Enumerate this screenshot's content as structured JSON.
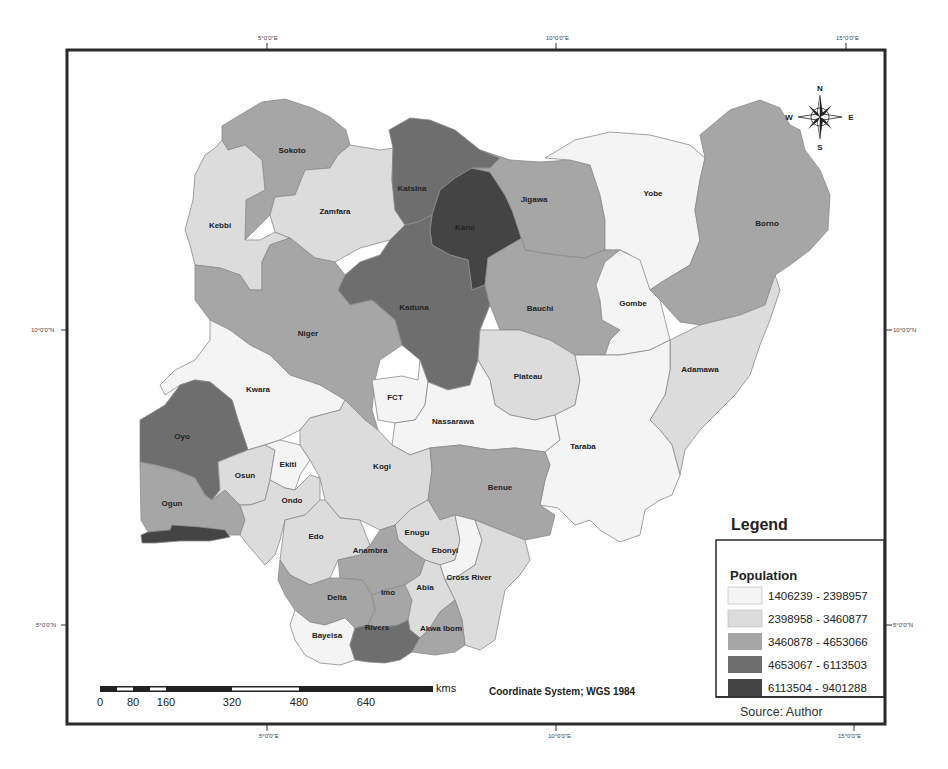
{
  "graticule": {
    "top_labels": [
      "5°0'0\"E",
      "10°0'0\"E",
      "15°0'0\"E"
    ],
    "bottom_labels": [
      "5°0'0\"E",
      "10°0'0\"E",
      "15°0'0\"E"
    ],
    "left_labels": [
      "10°0'0\"N",
      "5°0'0\"N"
    ],
    "right_labels": [
      "10°0'0\"N",
      "5°0'0\"N"
    ]
  },
  "compass": {
    "n": "N",
    "s": "S",
    "e": "E",
    "w": "W",
    "icon": "compass-rose-icon"
  },
  "colors": {
    "class1": "#f4f4f4",
    "class2": "#dcdcdc",
    "class3": "#a6a6a6",
    "class4": "#6e6e6e",
    "class5": "#444444"
  },
  "states": [
    {
      "name": "Sokoto",
      "class": 3
    },
    {
      "name": "Kebbi",
      "class": 2
    },
    {
      "name": "Zamfara",
      "class": 2
    },
    {
      "name": "Katsina",
      "class": 4
    },
    {
      "name": "Kano",
      "class": 5
    },
    {
      "name": "Jigawa",
      "class": 3
    },
    {
      "name": "Yobe",
      "class": 1
    },
    {
      "name": "Borno",
      "class": 3
    },
    {
      "name": "Kaduna",
      "class": 4
    },
    {
      "name": "Bauchi",
      "class": 3
    },
    {
      "name": "Gombe",
      "class": 1
    },
    {
      "name": "Niger",
      "class": 3
    },
    {
      "name": "Plateau",
      "class": 2
    },
    {
      "name": "Adamawa",
      "class": 2
    },
    {
      "name": "Kwara",
      "class": 1
    },
    {
      "name": "FCT",
      "class": 1
    },
    {
      "name": "Nassarawa",
      "class": 1
    },
    {
      "name": "Taraba",
      "class": 1
    },
    {
      "name": "Oyo",
      "class": 4
    },
    {
      "name": "Osun",
      "class": 2
    },
    {
      "name": "Ekiti",
      "class": 1
    },
    {
      "name": "Kogi",
      "class": 2
    },
    {
      "name": "Benue",
      "class": 3
    },
    {
      "name": "Ogun",
      "class": 3
    },
    {
      "name": "Lagos",
      "class": 5
    },
    {
      "name": "Ondo",
      "class": 2
    },
    {
      "name": "Edo",
      "class": 2
    },
    {
      "name": "Enugu",
      "class": 2
    },
    {
      "name": "Ebonyi",
      "class": 1
    },
    {
      "name": "Anambra",
      "class": 3
    },
    {
      "name": "Cross River",
      "class": 2
    },
    {
      "name": "Delta",
      "class": 3
    },
    {
      "name": "Imo",
      "class": 3
    },
    {
      "name": "Abia",
      "class": 2
    },
    {
      "name": "Bayelsa",
      "class": 1
    },
    {
      "name": "Rivers",
      "class": 4
    },
    {
      "name": "Akwa Ibom",
      "class": 3
    }
  ],
  "labels": {
    "sokoto": "Sokoto",
    "kebbi": "Kebbi",
    "zamfara": "Zamfara",
    "katsina": "Katsina",
    "kano": "Kano",
    "jigawa": "Jigawa",
    "yobe": "Yobe",
    "borno": "Borno",
    "kaduna": "Kaduna",
    "bauchi": "Bauchi",
    "gombe": "Gombe",
    "niger": "Niger",
    "plateau": "Plateau",
    "adamawa": "Adamawa",
    "kwara": "Kwara",
    "fct": "FCT",
    "nassarawa": "Nassarawa",
    "taraba": "Taraba",
    "oyo": "Oyo",
    "osun": "Osun",
    "ekiti": "Ekiti",
    "kogi": "Kogi",
    "benue": "Benue",
    "ogun": "Ogun",
    "ondo": "Ondo",
    "edo": "Edo",
    "enugu": "Enugu",
    "ebonyi": "Ebonyi",
    "anambra": "Anambra",
    "cross_river": "Cross River",
    "delta": "Delta",
    "imo": "Imo",
    "abia": "Abia",
    "bayelsa": "Bayelsa",
    "rivers": "Rivers",
    "akwa_ibom": "Akwa Ibom"
  },
  "legend": {
    "title": "Legend",
    "subtitle": "Population",
    "items": [
      {
        "label": "1406239 - 2398957",
        "color": "#f4f4f4"
      },
      {
        "label": "2398958 - 3460877",
        "color": "#dcdcdc"
      },
      {
        "label": "3460878 - 4653066",
        "color": "#a6a6a6"
      },
      {
        "label": "4653067 - 6113503",
        "color": "#6e6e6e"
      },
      {
        "label": "6113504 - 9401288",
        "color": "#444444"
      }
    ],
    "source": "Source: Author"
  },
  "scalebar": {
    "ticks": [
      "0",
      "80",
      "160",
      "320",
      "480",
      "640"
    ],
    "unit": "kms"
  },
  "coordinate_system": "Coordinate System; WGS 1984"
}
